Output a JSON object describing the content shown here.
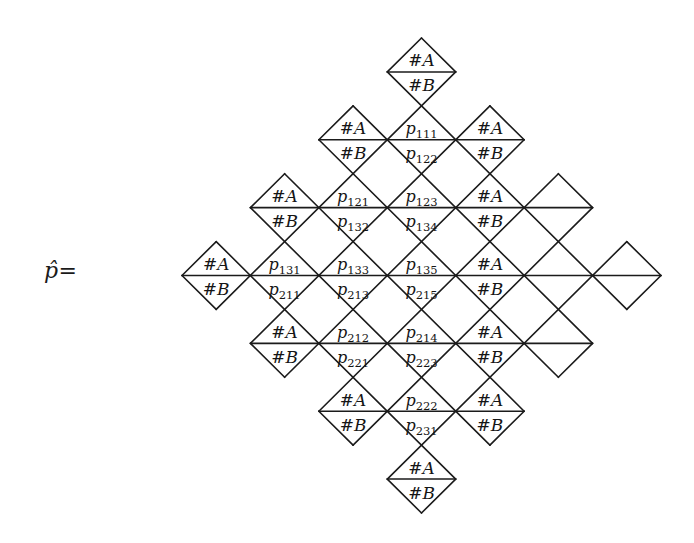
{
  "figure": {
    "kind": "triangulated-diamond-diagram",
    "lhs_label": {
      "symbol": "p̂",
      "equals": "="
    },
    "geometry": {
      "left_vertex_x": 182,
      "right_vertex_x": 661,
      "top_vertex_y": 38,
      "bottom_vertex_y": 513,
      "center_x": 421.5,
      "center_y": 275.5,
      "rows": 7,
      "cells_per_row": [
        1,
        3,
        5,
        7,
        5,
        3,
        1
      ],
      "cell_width": 68.43,
      "cell_height": 67.86,
      "line_color": "#1b1b1b",
      "line_width": 1.6,
      "background": "#ffffff"
    },
    "default_top_label": "#A",
    "default_bottom_label": "#B",
    "rows": [
      {
        "row": 0,
        "cells": [
          {
            "col": 0,
            "top": "#A",
            "bottom": "#B"
          }
        ]
      },
      {
        "row": 1,
        "cells": [
          {
            "col": 0,
            "top": "#A",
            "bottom": "#B"
          },
          {
            "col": 1,
            "top": "p_111",
            "bottom": "p_122"
          },
          {
            "col": 2,
            "top": "#A",
            "bottom": "#B"
          }
        ]
      },
      {
        "row": 2,
        "cells": [
          {
            "col": 0,
            "top": "#A",
            "bottom": "#B"
          },
          {
            "col": 1,
            "top": "p_121",
            "bottom": "p_132"
          },
          {
            "col": 2,
            "top": "p_123",
            "bottom": "p_134"
          },
          {
            "col": 3,
            "top": "#A",
            "bottom": "#B"
          }
        ]
      },
      {
        "row": 3,
        "cells": [
          {
            "col": 0,
            "top": "#A",
            "bottom": "#B"
          },
          {
            "col": 1,
            "top": "p_131",
            "bottom": "p_211"
          },
          {
            "col": 2,
            "top": "p_133",
            "bottom": "p_213"
          },
          {
            "col": 3,
            "top": "p_135",
            "bottom": "p_215"
          },
          {
            "col": 4,
            "top": "#A",
            "bottom": "#B"
          }
        ]
      },
      {
        "row": 4,
        "cells": [
          {
            "col": 0,
            "top": "#A",
            "bottom": "#B"
          },
          {
            "col": 1,
            "top": "p_212",
            "bottom": "p_221"
          },
          {
            "col": 2,
            "top": "p_214",
            "bottom": "p_223"
          },
          {
            "col": 3,
            "top": "#A",
            "bottom": "#B"
          }
        ]
      },
      {
        "row": 5,
        "cells": [
          {
            "col": 0,
            "top": "#A",
            "bottom": "#B"
          },
          {
            "col": 1,
            "top": "p_222",
            "bottom": "p_231"
          },
          {
            "col": 2,
            "top": "#A",
            "bottom": "#B"
          }
        ]
      },
      {
        "row": 6,
        "cells": [
          {
            "col": 0,
            "top": "#A",
            "bottom": "#B"
          }
        ]
      }
    ],
    "p_labels": [
      "p_111",
      "p_121",
      "p_122",
      "p_123",
      "p_131",
      "p_132",
      "p_133",
      "p_134",
      "p_135",
      "p_211",
      "p_212",
      "p_213",
      "p_214",
      "p_215",
      "p_221",
      "p_222",
      "p_223",
      "p_231"
    ]
  }
}
